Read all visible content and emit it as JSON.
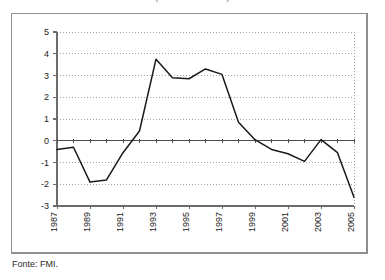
{
  "figure": {
    "title_clipped": "(........................)",
    "source_note": "Fonte: FMI."
  },
  "chart_data": {
    "type": "line",
    "title": "",
    "xlabel": "",
    "ylabel": "",
    "x": [
      1987,
      1988,
      1989,
      1990,
      1991,
      1992,
      1993,
      1994,
      1995,
      1996,
      1997,
      1998,
      1999,
      2000,
      2001,
      2002,
      2003,
      2004,
      2005
    ],
    "values": [
      -0.4,
      -0.3,
      -1.9,
      -1.8,
      -0.55,
      0.45,
      3.75,
      2.9,
      2.85,
      3.3,
      3.05,
      0.85,
      0.05,
      -0.4,
      -0.6,
      -0.95,
      0.05,
      -0.55,
      -2.6
    ],
    "series": [
      {
        "name": "series-1",
        "values": [
          -0.4,
          -0.3,
          -1.9,
          -1.8,
          -0.55,
          0.45,
          3.75,
          2.9,
          2.85,
          3.3,
          3.05,
          0.85,
          0.05,
          -0.4,
          -0.6,
          -0.95,
          0.05,
          -0.55,
          -2.6
        ]
      }
    ],
    "xlim": [
      1987,
      2005
    ],
    "ylim": [
      -3,
      5
    ],
    "yticks": [
      5,
      4,
      3,
      2,
      1,
      0,
      -1,
      -2,
      -3
    ],
    "ytick_labels": [
      "5",
      "4",
      "3",
      "2",
      "1",
      "0",
      "-1",
      "-2",
      "-3"
    ],
    "xticks": [
      1987,
      1989,
      1991,
      1993,
      1995,
      1997,
      1999,
      2001,
      2003,
      2005
    ],
    "xtick_labels": [
      "1987",
      "1989",
      "1991",
      "1993",
      "1995",
      "1997",
      "1999",
      "2001",
      "2003",
      "2005"
    ],
    "xtick_rotation": 90,
    "grid": true,
    "grid_style": "dotted",
    "legend": false,
    "line_color": "#1a1a1a",
    "grid_color": "#8c8c8c",
    "axis_color": "#6b6b6b",
    "zero_line_color": "#4d4d4d"
  }
}
